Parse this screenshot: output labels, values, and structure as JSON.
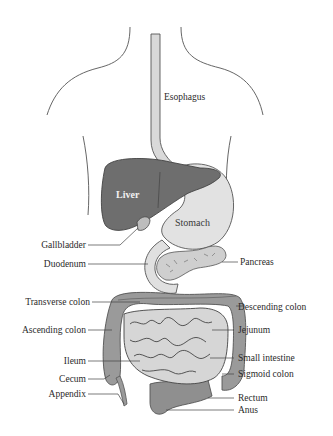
{
  "diagram": {
    "colors": {
      "outline": "#555555",
      "liver": "#6e6e6e",
      "stomach": "#e2e2e2",
      "esophagus": "#d9d9d9",
      "colon": "#9a9a9a",
      "small_intestine": "#d6d6d6",
      "pancreas": "#cfcfcf",
      "leader": "#444444",
      "label_text": "#2a2a2a"
    },
    "organ_labels": {
      "liver": "Liver",
      "stomach": "Stomach"
    },
    "labels_left": [
      {
        "id": "gallbladder",
        "text": "Gallbladder"
      },
      {
        "id": "duodenum",
        "text": "Duodenum"
      },
      {
        "id": "transverse-colon",
        "text": "Transverse colon"
      },
      {
        "id": "ascending-colon",
        "text": "Ascending colon"
      },
      {
        "id": "ileum",
        "text": "Ileum"
      },
      {
        "id": "cecum",
        "text": "Cecum"
      },
      {
        "id": "appendix",
        "text": "Appendix"
      }
    ],
    "labels_right": [
      {
        "id": "esophagus",
        "text": "Esophagus"
      },
      {
        "id": "pancreas",
        "text": "Pancreas"
      },
      {
        "id": "descending-colon",
        "text": "Descending colon"
      },
      {
        "id": "jejunum",
        "text": "Jejunum"
      },
      {
        "id": "small-intestine",
        "text": "Small intestine"
      },
      {
        "id": "sigmoid-colon",
        "text": "Sigmoid colon"
      },
      {
        "id": "rectum",
        "text": "Rectum"
      },
      {
        "id": "anus",
        "text": "Anus"
      }
    ]
  }
}
